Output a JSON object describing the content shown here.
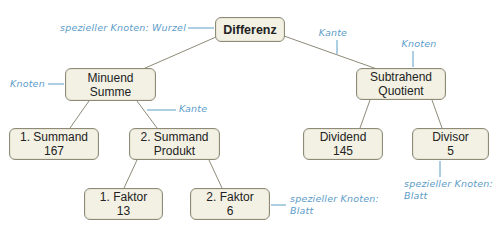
{
  "diagram": {
    "type": "tree",
    "root": {
      "line1": "Differenz"
    },
    "nodes": {
      "minuend": {
        "line1": "Minuend",
        "line2": "Summe"
      },
      "subtrahend": {
        "line1": "Subtrahend",
        "line2": "Quotient"
      },
      "summand1": {
        "line1": "1. Summand",
        "line2": "167"
      },
      "summand2": {
        "line1": "2. Summand",
        "line2": "Produkt"
      },
      "faktor1": {
        "line1": "1. Faktor",
        "line2": "13"
      },
      "faktor2": {
        "line1": "2. Faktor",
        "line2": "6"
      },
      "dividend": {
        "line1": "Dividend",
        "line2": "145"
      },
      "divisor": {
        "line1": "Divisor",
        "line2": "5"
      }
    },
    "annotations": {
      "root_label": "spezieller Knoten: Wurzel",
      "node_left": "Knoten",
      "edge_left": "Kante",
      "edge_right": "Kante",
      "node_right": "Knoten",
      "leaf_mid_line1": "spezieller Knoten:",
      "leaf_mid_line2": "Blatt",
      "leaf_right_line1": "spezieller Knoten:",
      "leaf_right_line2": "Blatt"
    },
    "colors": {
      "node_fill": "#f3f1e4",
      "node_border": "#8e8a78",
      "edge": "#8e8a78",
      "annotation": "#5c9cc8"
    }
  }
}
